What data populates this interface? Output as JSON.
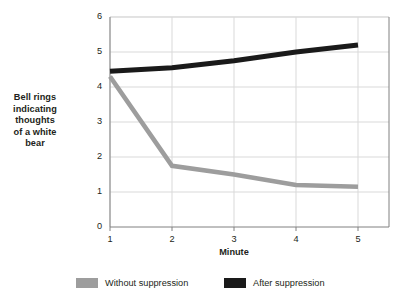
{
  "chart_data": {
    "type": "line",
    "title": "",
    "xlabel": "Minute",
    "ylabel": "Bell rings indicating thoughts of a white bear",
    "x": [
      1,
      2,
      3,
      4,
      5
    ],
    "xticklabels": [
      "1",
      "2",
      "3",
      "4",
      "5"
    ],
    "yticklabels": [
      "0",
      "1",
      "2",
      "3",
      "4",
      "5",
      "6"
    ],
    "xlim": [
      0.5,
      5.5
    ],
    "ylim": [
      0,
      6
    ],
    "grid": true,
    "legend_position": "bottom",
    "series": [
      {
        "name": "Without suppression",
        "color": "#9d9d9d",
        "values": [
          4.3,
          1.75,
          1.5,
          1.2,
          1.15
        ]
      },
      {
        "name": "After suppression",
        "color": "#1a1a1a",
        "values": [
          4.45,
          4.55,
          4.75,
          5.0,
          5.2
        ]
      }
    ]
  },
  "axis": {
    "y_title_lines": [
      "Bell rings",
      "indicating",
      "thoughts",
      "of a white",
      "bear"
    ],
    "y_title_text": "Bell rings indicating thoughts of a white bear",
    "x_title": "Minute"
  },
  "colors": {
    "series_without_suppression": "#9d9d9d",
    "series_after_suppression": "#1a1a1a",
    "grid": "#d9d9d9",
    "axis": "#808080",
    "text": "#231f20",
    "background": "#ffffff"
  }
}
